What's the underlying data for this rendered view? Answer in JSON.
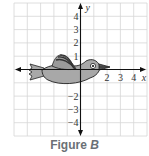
{
  "figure": {
    "caption_prefix": "Figure",
    "caption_letter": "B",
    "axes": {
      "x_label": "x",
      "y_label": "y",
      "x_range": [
        -5,
        5
      ],
      "y_range": [
        -5,
        5
      ],
      "x_tick_labels": [
        "2",
        "3",
        "4"
      ],
      "x_tick_values": [
        2,
        3,
        4
      ],
      "y_tick_labels": [
        "4",
        "3",
        "2",
        "1",
        "−2",
        "−3",
        "−4"
      ],
      "y_tick_values": [
        4,
        3,
        2,
        1,
        -2,
        -3,
        -4
      ],
      "grid": true
    },
    "shape": {
      "description": "bird",
      "body_color": "#a8a8a8",
      "outline_color": "#222222",
      "wing_color": "#555555",
      "eye_color": "#ffffff"
    },
    "colors": {
      "grid": "#d6d6d6",
      "axis": "#111111"
    }
  }
}
